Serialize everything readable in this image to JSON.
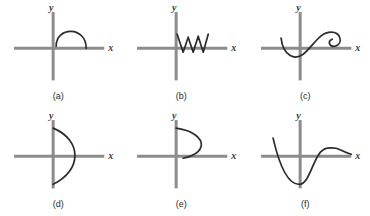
{
  "figure": {
    "columns": 3,
    "rows": 2,
    "axis_color": "#8c8c8c",
    "curve_color": "#2b2b2b",
    "background_color": "#ffffff",
    "x_axis_label": "x",
    "y_axis_label": "y",
    "panels": [
      {
        "id": "a",
        "caption": "(a)",
        "curve_name": "semicircular-arch",
        "description": "Downward-opening semicircular arch above the x-axis, to the right of the y-axis",
        "path": "M 56 46 C 56 26, 86 26, 86 48"
      },
      {
        "id": "b",
        "caption": "(b)",
        "curve_name": "zigzag-wave",
        "description": "Sharp zigzag (W-like sawtooth) with three peaks, sitting just above the x-axis starting at the y-axis",
        "path": "M 54 34 L 60 52 L 65 37 L 70 52 L 75 36 L 80 52 L 85 34"
      },
      {
        "id": "c",
        "caption": "(c)",
        "curve_name": "s-curve-with-spiral",
        "description": "Descending left arm, a dip near the origin, an S-shaped rise, ending in a clockwise spiral curl",
        "path": "M 34 38 C 36 56, 48 60, 56 54 C 66 46, 72 32, 84 32 C 94 32, 96 44, 88 46 C 82 47, 80 41, 85 39"
      },
      {
        "id": "d",
        "caption": "(d)",
        "curve_name": "vertical-bow-arc",
        "description": "Bow-shaped arc from the top of the y-axis bulging right and returning to the bottom of the y-axis",
        "path": "M 53 20 C 82 32, 82 62, 53 76"
      },
      {
        "id": "e",
        "caption": "(e)",
        "curve_name": "rightward-opening-arc",
        "description": "Arc starting at the top of the y-axis, bulging right, ending on the x-axis near the origin",
        "path": "M 53 20 C 82 24, 88 44, 60 50"
      },
      {
        "id": "f",
        "caption": "(f)",
        "curve_name": "cubic-wave",
        "description": "Curve from upper left plunging to a deep minimum left of the origin, rising steeply across the axis to a peak on the right, then easing down",
        "path": "M 26 30 C 32 56, 40 76, 52 76 C 64 76, 66 42, 80 40 C 92 38, 94 44, 104 46"
      }
    ]
  }
}
